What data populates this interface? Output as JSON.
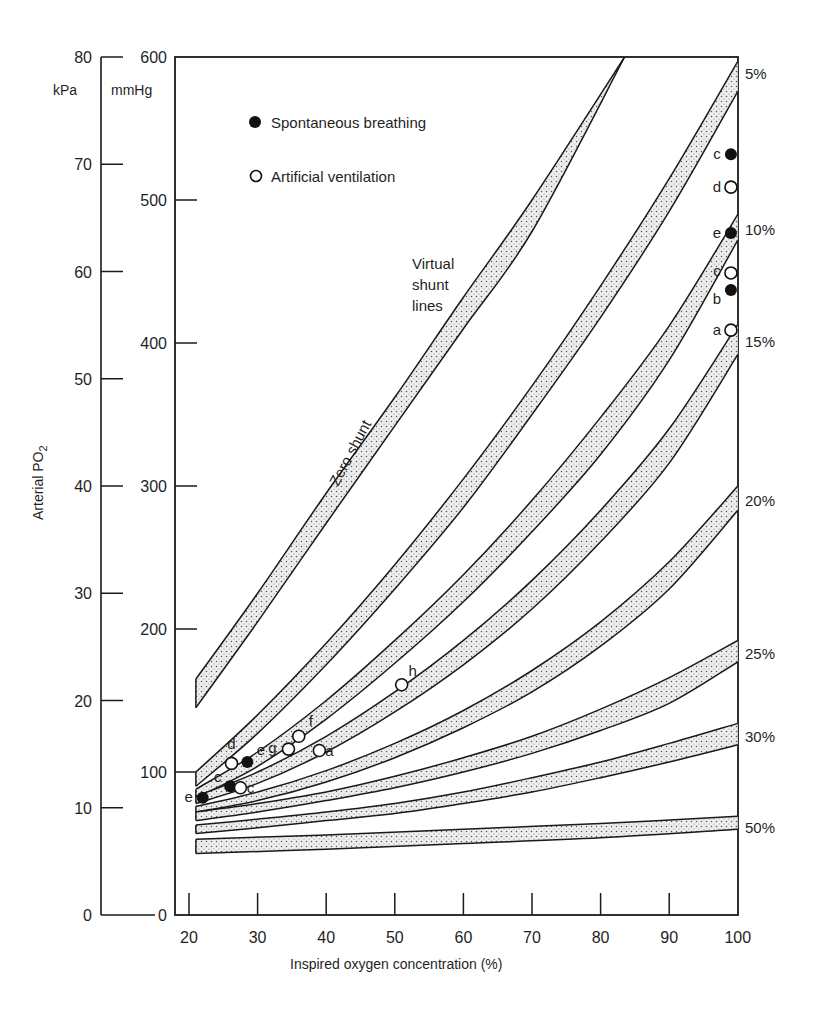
{
  "chart_data": {
    "type": "line",
    "title": "",
    "xlabel": "Inspired oxygen concentration (%)",
    "ylabel": "Arterial PO2",
    "ylabel_main": "Arterial PO",
    "ylabel_sub": "2",
    "xlim": [
      20,
      100
    ],
    "ylim_mmHg": [
      0,
      600
    ],
    "ylim_kPa": [
      0,
      80
    ],
    "x_ticks": [
      "20",
      "30",
      "40",
      "50",
      "60",
      "70",
      "80",
      "90",
      "100"
    ],
    "y_ticks_mmHg": [
      "0",
      "100",
      "200",
      "300",
      "400",
      "500",
      "600"
    ],
    "y_ticks_kPa": [
      "0",
      "10",
      "20",
      "30",
      "40",
      "50",
      "60",
      "70",
      "80"
    ],
    "unit_kPa": "kPa",
    "unit_mmHg": "mmHg",
    "grid": false,
    "legend": {
      "position": "upper-left",
      "items": [
        {
          "marker": "filled-circle",
          "label": "Spontaneous breathing"
        },
        {
          "marker": "open-circle",
          "label": "Artificial ventilation"
        }
      ]
    },
    "annotations": {
      "virtual_shunt_1": "Virtual",
      "virtual_shunt_2": "shunt",
      "virtual_shunt_3": "lines",
      "zero_shunt": "Zero shunt"
    },
    "series": [
      {
        "name": "Zero shunt",
        "label": "",
        "x": [
          21,
          30,
          40,
          50,
          60,
          70,
          83.5
        ],
        "upper": [
          165,
          225,
          295,
          362,
          432,
          500,
          600
        ],
        "lower": [
          145,
          205,
          274,
          342,
          410,
          478,
          600
        ]
      },
      {
        "name": "5%",
        "label": "5%",
        "x": [
          21,
          30,
          40,
          50,
          60,
          70,
          80,
          90,
          100
        ],
        "upper": [
          100,
          140,
          190,
          245,
          305,
          370,
          440,
          515,
          597
        ],
        "lower": [
          90,
          127,
          175,
          228,
          285,
          350,
          418,
          492,
          576
        ]
      },
      {
        "name": "10%",
        "label": "10%",
        "x": [
          21,
          30,
          40,
          50,
          60,
          70,
          80,
          90,
          100
        ],
        "upper": [
          88,
          114,
          150,
          192,
          238,
          290,
          348,
          412,
          490
        ],
        "lower": [
          82,
          104,
          137,
          176,
          219,
          268,
          322,
          388,
          472
        ]
      },
      {
        "name": "15%",
        "label": "15%",
        "x": [
          21,
          30,
          40,
          50,
          60,
          70,
          80,
          90,
          100
        ],
        "upper": [
          83,
          100,
          125,
          156,
          192,
          234,
          283,
          340,
          413
        ],
        "lower": [
          78,
          92,
          114,
          142,
          175,
          214,
          261,
          316,
          392
        ]
      },
      {
        "name": "20%",
        "label": "20%",
        "x": [
          21,
          30,
          40,
          50,
          60,
          70,
          80,
          90,
          100
        ],
        "upper": [
          76,
          86,
          101,
          120,
          143,
          171,
          205,
          247,
          300
        ],
        "lower": [
          72,
          80,
          93,
          110,
          131,
          156,
          188,
          228,
          283
        ]
      },
      {
        "name": "25%",
        "label": "25%",
        "x": [
          21,
          30,
          40,
          50,
          60,
          70,
          80,
          90,
          100
        ],
        "upper": [
          72,
          78,
          86,
          97,
          110,
          125,
          144,
          166,
          192
        ],
        "lower": [
          66,
          72,
          80,
          89,
          100,
          113,
          129,
          148,
          177
        ]
      },
      {
        "name": "30%",
        "label": "30%",
        "x": [
          21,
          30,
          40,
          50,
          60,
          70,
          80,
          90,
          100
        ],
        "upper": [
          63,
          67,
          72,
          78,
          86,
          96,
          107,
          120,
          134
        ],
        "lower": [
          57,
          61,
          66,
          71,
          78,
          86,
          96,
          107,
          119
        ]
      },
      {
        "name": "50%",
        "label": "50%",
        "x": [
          21,
          40,
          60,
          80,
          100
        ],
        "upper": [
          53,
          56,
          60,
          64,
          69
        ],
        "lower": [
          43,
          46,
          50,
          54,
          60
        ]
      }
    ],
    "points": [
      {
        "group": "spontaneous",
        "label": "e",
        "x": 22,
        "y": 82,
        "lx": -14,
        "ly": 4
      },
      {
        "group": "spontaneous",
        "label": "",
        "x": 26,
        "y": 90,
        "lx": 0,
        "ly": 0
      },
      {
        "group": "spontaneous",
        "label": "",
        "x": 28.5,
        "y": 107,
        "lx": 0,
        "ly": 0
      },
      {
        "group": "artificial",
        "label": "c",
        "x": 27.5,
        "y": 89,
        "lx": 10,
        "ly": 5
      },
      {
        "group": "artificial",
        "label": "d",
        "x": 26.2,
        "y": 106,
        "lx": 0,
        "ly": -14
      },
      {
        "group": "artificial",
        "label": "f",
        "x": 36,
        "y": 125,
        "lx": 12,
        "ly": -10
      },
      {
        "group": "artificial",
        "label": "g",
        "x": 34.5,
        "y": 116,
        "lx": -16,
        "ly": 4
      },
      {
        "group": "artificial",
        "label": "a",
        "x": 39,
        "y": 115,
        "lx": 10,
        "ly": 5
      },
      {
        "group": "artificial",
        "label": "h",
        "x": 51,
        "y": 161,
        "lx": 11,
        "ly": -9
      },
      {
        "group": "spontaneous",
        "label": "c",
        "x": 99,
        "y": 532,
        "lx": -14,
        "ly": 5
      },
      {
        "group": "artificial",
        "label": "d",
        "x": 99,
        "y": 509,
        "lx": -14,
        "ly": 5
      },
      {
        "group": "spontaneous",
        "label": "e",
        "x": 99,
        "y": 477,
        "lx": -14,
        "ly": 5
      },
      {
        "group": "artificial",
        "label": "c",
        "x": 99,
        "y": 449,
        "lx": -14,
        "ly": 3
      },
      {
        "group": "spontaneous",
        "label": "b",
        "x": 99,
        "y": 437,
        "lx": -14,
        "ly": 14
      },
      {
        "group": "artificial",
        "label": "a",
        "x": 99,
        "y": 409,
        "lx": -14,
        "ly": 5
      }
    ],
    "extra_labels": [
      {
        "text": "c",
        "x": 24.2,
        "y": 93
      },
      {
        "text": "e",
        "x": 30.5,
        "y": 112
      }
    ]
  },
  "colors": {
    "ink": "#1a1a1a",
    "band_fill": "#e6e6e6",
    "dot": "#6a6a6a",
    "background": "#ffffff"
  }
}
